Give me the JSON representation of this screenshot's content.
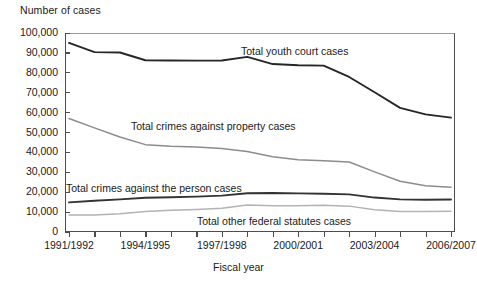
{
  "chart_data": {
    "type": "line",
    "title": "",
    "ylabel": "Number of cases",
    "xlabel": "Fiscal year",
    "ylim": [
      0,
      100000
    ],
    "ytick_labels": [
      "100,000",
      "90,000",
      "80,000",
      "70,000",
      "60,000",
      "50,000",
      "40,000",
      "30,000",
      "20,000",
      "10,000",
      "0"
    ],
    "ytick_values": [
      100000,
      90000,
      80000,
      70000,
      60000,
      50000,
      40000,
      30000,
      20000,
      10000,
      0
    ],
    "grid": false,
    "legend_position": "inline-annotations",
    "categories": [
      "1991/1992",
      "1992/1993",
      "1993/1994",
      "1994/1995",
      "1995/1996",
      "1996/1997",
      "1997/1998",
      "1998/1999",
      "1999/2000",
      "2000/2001",
      "2001/2002",
      "2002/2003",
      "2003/2004",
      "2004/2005",
      "2005/2006",
      "2006/2007"
    ],
    "xtick_labels_shown": [
      "1991/1992",
      "1994/1995",
      "1997/1998",
      "2000/2001",
      "2003/2004",
      "2006/2007"
    ],
    "series": [
      {
        "name": "Total youth court cases",
        "color": "#262626",
        "values": [
          95000,
          90400,
          90200,
          86300,
          86200,
          86100,
          86200,
          88000,
          84400,
          83800,
          83600,
          77900,
          70200,
          62400,
          59100,
          57500
        ]
      },
      {
        "name": "Total crimes against property cases",
        "color": "#8c8c8c",
        "values": [
          57000,
          52300,
          47700,
          43900,
          43100,
          42700,
          42000,
          40400,
          37800,
          36300,
          35800,
          35200,
          30200,
          25500,
          23200,
          22500
        ]
      },
      {
        "name": "Total crimes against the person cases",
        "color": "#333333",
        "values": [
          14900,
          15700,
          16400,
          17200,
          17500,
          17800,
          18300,
          19500,
          19600,
          19400,
          19200,
          18900,
          17300,
          16400,
          16200,
          16300
        ]
      },
      {
        "name": "Total other federal statutes cases",
        "color": "#b3b3b3",
        "values": [
          8500,
          8500,
          9200,
          10300,
          10900,
          11300,
          11900,
          13600,
          13200,
          13200,
          13400,
          13000,
          11200,
          10300,
          10300,
          10400
        ]
      }
    ],
    "annotations": [
      {
        "text": "Total youth court cases",
        "x_px": 241,
        "y_px": 45
      },
      {
        "text": "Total crimes against property cases",
        "x_px": 131,
        "y_px": 120
      },
      {
        "text": "Total crimes against the person cases",
        "x_px": 66,
        "y_px": 182
      },
      {
        "text": "Total other federal statutes cases",
        "x_px": 197,
        "y_px": 215
      }
    ]
  }
}
